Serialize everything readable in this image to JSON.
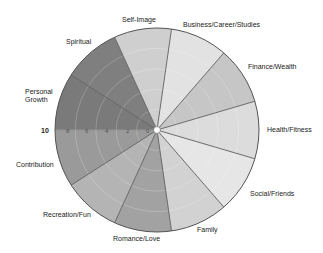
{
  "chart_data": {
    "type": "pie",
    "subtype": "wheel-of-life",
    "title": "",
    "center": [
      157,
      130
    ],
    "radius": 102,
    "max_value": 10,
    "rings": [
      2,
      4,
      6,
      8,
      10
    ],
    "axis_ticks": [
      "10",
      "8",
      "6",
      "4",
      "2",
      "0"
    ],
    "categories": [
      "Personal Growth",
      "Spiritual",
      "Self-Image",
      "Business/Career/Studies",
      "Finance/Wealth",
      "Health/Fitness",
      "Social/Friends",
      "Family",
      "Romance/Love",
      "Recreation/Fun",
      "Contribution"
    ],
    "values": [
      10,
      10,
      10,
      10,
      10,
      10,
      10,
      10,
      10,
      10,
      10
    ],
    "colors": [
      "#7a7a7a",
      "#7f7f7f",
      "#cfcfcf",
      "#e2e2e2",
      "#c6c6c6",
      "#dcdcdc",
      "#e6e6e6",
      "#d2d2d2",
      "#a2a2a2",
      "#b4b4b4",
      "#9a9a9a"
    ],
    "legend": "none",
    "grid": true
  },
  "labels": {
    "self_image": "Self-Image",
    "business": "Business/Career/Studies",
    "finance": "Finance/Wealth",
    "health": "Health/Fitness",
    "social": "Social/Friends",
    "family": "Family",
    "romance": "Romance/Love",
    "recreation": "Recreation/Fun",
    "contribution": "Contribution",
    "personal_growth_1": "Personal",
    "personal_growth_2": "Growth",
    "spiritual": "Spiritual"
  },
  "axis": {
    "t10": "10",
    "t8": "8",
    "t6": "6",
    "t4": "4",
    "t2": "2",
    "t0": "0"
  }
}
